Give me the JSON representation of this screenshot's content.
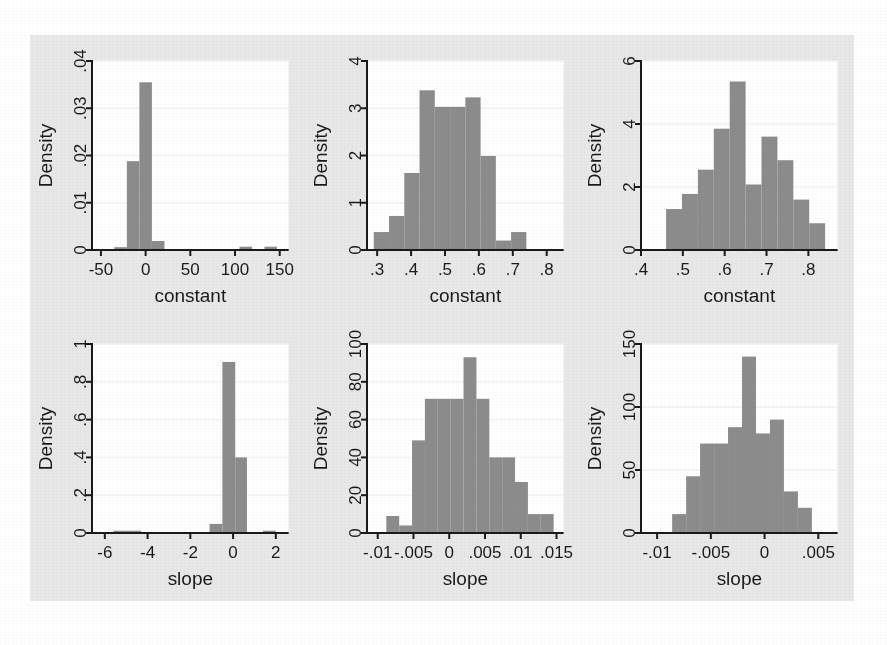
{
  "figure": {
    "background_color": "#e8e8e8",
    "plot_background_color": "#ffffff",
    "bar_color": "#8c8c8c",
    "axis_color": "#1a1a1a",
    "gridline_color": "#f2f2f2",
    "panel_count": 6,
    "layout": "2 rows x 3 columns"
  },
  "chart_data": [
    {
      "type": "bar",
      "title": "",
      "xlabel": "constant",
      "ylabel": "Density",
      "xlim": [
        -60,
        160
      ],
      "ylim": [
        0,
        0.04
      ],
      "xticks": [
        "-50",
        "0",
        "50",
        "100",
        "150"
      ],
      "xtick_values": [
        -50,
        0,
        50,
        100,
        150
      ],
      "yticks": [
        "0",
        ".01",
        ".02",
        ".03",
        ".04"
      ],
      "ytick_values": [
        0,
        0.01,
        0.02,
        0.03,
        0.04
      ],
      "grid": true,
      "legend": "none",
      "bin_edges": [
        -35,
        -21,
        -7,
        7,
        21,
        35,
        105,
        119,
        133,
        147
      ],
      "bins": [
        {
          "x0": -35,
          "x1": -21,
          "value": 0.0006
        },
        {
          "x0": -21,
          "x1": -7,
          "value": 0.0188
        },
        {
          "x0": -7,
          "x1": 7,
          "value": 0.0355
        },
        {
          "x0": 7,
          "x1": 21,
          "value": 0.0019
        },
        {
          "x0": 105,
          "x1": 119,
          "value": 0.0007
        },
        {
          "x0": 133,
          "x1": 147,
          "value": 0.0007
        }
      ]
    },
    {
      "type": "bar",
      "title": "",
      "xlabel": "constant",
      "ylabel": "Density",
      "xlim": [
        0.27,
        0.85
      ],
      "ylim": [
        0,
        4
      ],
      "xticks": [
        ".3",
        ".4",
        ".5",
        ".6",
        ".7",
        ".8"
      ],
      "xtick_values": [
        0.3,
        0.4,
        0.5,
        0.6,
        0.7,
        0.8
      ],
      "yticks": [
        "0",
        "1",
        "2",
        "3",
        "4"
      ],
      "ytick_values": [
        0,
        1,
        2,
        3,
        4
      ],
      "grid": true,
      "legend": "none",
      "bin_edges": [
        0.29,
        0.335,
        0.38,
        0.425,
        0.47,
        0.515,
        0.56,
        0.605,
        0.65,
        0.695,
        0.74,
        0.785,
        0.83
      ],
      "bins": [
        {
          "x0": 0.29,
          "x1": 0.335,
          "value": 0.38
        },
        {
          "x0": 0.335,
          "x1": 0.38,
          "value": 0.72
        },
        {
          "x0": 0.38,
          "x1": 0.425,
          "value": 1.63
        },
        {
          "x0": 0.425,
          "x1": 0.47,
          "value": 3.38
        },
        {
          "x0": 0.47,
          "x1": 0.515,
          "value": 3.03
        },
        {
          "x0": 0.515,
          "x1": 0.56,
          "value": 3.03
        },
        {
          "x0": 0.56,
          "x1": 0.605,
          "value": 3.23
        },
        {
          "x0": 0.605,
          "x1": 0.65,
          "value": 1.99
        },
        {
          "x0": 0.65,
          "x1": 0.695,
          "value": 0.2
        },
        {
          "x0": 0.695,
          "x1": 0.74,
          "value": 0.38
        }
      ]
    },
    {
      "type": "bar",
      "title": "",
      "xlabel": "constant",
      "ylabel": "Density",
      "xlim": [
        0.4,
        0.87
      ],
      "ylim": [
        0,
        6
      ],
      "xticks": [
        ".4",
        ".5",
        ".6",
        ".7",
        ".8"
      ],
      "xtick_values": [
        0.4,
        0.5,
        0.6,
        0.7,
        0.8
      ],
      "yticks": [
        "0",
        "2",
        "4",
        "6"
      ],
      "ytick_values": [
        0,
        2,
        4,
        6
      ],
      "grid": true,
      "legend": "none",
      "bin_edges": [
        0.46,
        0.498,
        0.536,
        0.574,
        0.612,
        0.65,
        0.688,
        0.726,
        0.764,
        0.802,
        0.84
      ],
      "bins": [
        {
          "x0": 0.46,
          "x1": 0.498,
          "value": 1.3
        },
        {
          "x0": 0.498,
          "x1": 0.536,
          "value": 1.78
        },
        {
          "x0": 0.536,
          "x1": 0.574,
          "value": 2.55
        },
        {
          "x0": 0.574,
          "x1": 0.612,
          "value": 3.85
        },
        {
          "x0": 0.612,
          "x1": 0.65,
          "value": 5.35
        },
        {
          "x0": 0.65,
          "x1": 0.688,
          "value": 2.08
        },
        {
          "x0": 0.688,
          "x1": 0.726,
          "value": 3.6
        },
        {
          "x0": 0.726,
          "x1": 0.764,
          "value": 2.85
        },
        {
          "x0": 0.764,
          "x1": 0.802,
          "value": 1.6
        },
        {
          "x0": 0.802,
          "x1": 0.84,
          "value": 0.85
        }
      ]
    },
    {
      "type": "bar",
      "title": "",
      "xlabel": "slope",
      "ylabel": "Density",
      "xlim": [
        -6.6,
        2.6
      ],
      "ylim": [
        0,
        1
      ],
      "xticks": [
        "-6",
        "-4",
        "-2",
        "0",
        "2"
      ],
      "xtick_values": [
        -6,
        -4,
        -2,
        0,
        2
      ],
      "yticks": [
        "0",
        ".2",
        ".4",
        ".6",
        ".8",
        "1"
      ],
      "ytick_values": [
        0,
        0.2,
        0.4,
        0.6,
        0.8,
        1
      ],
      "grid": true,
      "legend": "none",
      "bin_edges": [
        -5.6,
        -4.65,
        -1.1,
        -0.5,
        0.6,
        1.35,
        2.0
      ],
      "bins": [
        {
          "x0": -5.6,
          "x1": -4.3,
          "value": 0.012
        },
        {
          "x0": -1.1,
          "x1": -0.5,
          "value": 0.048
        },
        {
          "x0": -0.5,
          "x1": 0.1,
          "value": 0.905
        },
        {
          "x0": 0.1,
          "x1": 0.65,
          "value": 0.4
        },
        {
          "x0": 1.4,
          "x1": 2.0,
          "value": 0.012
        }
      ]
    },
    {
      "type": "bar",
      "title": "",
      "xlabel": "slope",
      "ylabel": "Density",
      "xlim": [
        -0.0115,
        0.016
      ],
      "ylim": [
        0,
        100
      ],
      "xticks": [
        "-.01",
        "-.005",
        "0",
        ".005",
        ".01",
        ".015"
      ],
      "xtick_values": [
        -0.01,
        -0.005,
        0,
        0.005,
        0.01,
        0.015
      ],
      "yticks": [
        "0",
        "20",
        "40",
        "60",
        "80",
        "100"
      ],
      "ytick_values": [
        0,
        20,
        40,
        60,
        80,
        100
      ],
      "grid": true,
      "legend": "none",
      "bin_edges": [
        -0.0088,
        -0.007,
        -0.0052,
        -0.0034,
        -0.0016,
        0.0002,
        0.002,
        0.0038,
        0.0056,
        0.0074,
        0.0092,
        0.011,
        0.0128,
        0.0146
      ],
      "bins": [
        {
          "x0": -0.0088,
          "x1": -0.007,
          "value": 9
        },
        {
          "x0": -0.007,
          "x1": -0.0052,
          "value": 4
        },
        {
          "x0": -0.0052,
          "x1": -0.0034,
          "value": 49
        },
        {
          "x0": -0.0034,
          "x1": -0.0016,
          "value": 71
        },
        {
          "x0": -0.0016,
          "x1": 0.0002,
          "value": 71
        },
        {
          "x0": 0.0002,
          "x1": 0.002,
          "value": 71
        },
        {
          "x0": 0.002,
          "x1": 0.0038,
          "value": 93
        },
        {
          "x0": 0.0038,
          "x1": 0.0056,
          "value": 71
        },
        {
          "x0": 0.0056,
          "x1": 0.0074,
          "value": 40
        },
        {
          "x0": 0.0074,
          "x1": 0.0092,
          "value": 40
        },
        {
          "x0": 0.0092,
          "x1": 0.011,
          "value": 27
        },
        {
          "x0": 0.011,
          "x1": 0.0128,
          "value": 10
        },
        {
          "x0": 0.0128,
          "x1": 0.0146,
          "value": 10
        }
      ]
    },
    {
      "type": "bar",
      "title": "",
      "xlabel": "slope",
      "ylabel": "Density",
      "xlim": [
        -0.0115,
        0.0068
      ],
      "ylim": [
        0,
        150
      ],
      "xticks": [
        "-.01",
        "-.005",
        "0",
        ".005"
      ],
      "xtick_values": [
        -0.01,
        -0.005,
        0,
        0.005
      ],
      "yticks": [
        "0",
        "50",
        "100",
        "150"
      ],
      "ytick_values": [
        0,
        50,
        100,
        150
      ],
      "grid": true,
      "legend": "none",
      "bin_edges": [
        -0.0086,
        -0.0073,
        -0.006,
        -0.0047,
        -0.0034,
        -0.0021,
        -0.0008,
        0.0005,
        0.0018,
        0.0031,
        0.0044,
        0.0057
      ],
      "bins": [
        {
          "x0": -0.0086,
          "x1": -0.0073,
          "value": 15
        },
        {
          "x0": -0.0073,
          "x1": -0.006,
          "value": 45
        },
        {
          "x0": -0.006,
          "x1": -0.0047,
          "value": 71
        },
        {
          "x0": -0.0047,
          "x1": -0.0034,
          "value": 71
        },
        {
          "x0": -0.0034,
          "x1": -0.0021,
          "value": 84
        },
        {
          "x0": -0.0021,
          "x1": -0.0008,
          "value": 140
        },
        {
          "x0": -0.0008,
          "x1": 0.0005,
          "value": 79
        },
        {
          "x0": 0.0005,
          "x1": 0.0018,
          "value": 90
        },
        {
          "x0": 0.0018,
          "x1": 0.0031,
          "value": 33
        },
        {
          "x0": 0.0031,
          "x1": 0.0044,
          "value": 20
        }
      ]
    }
  ]
}
